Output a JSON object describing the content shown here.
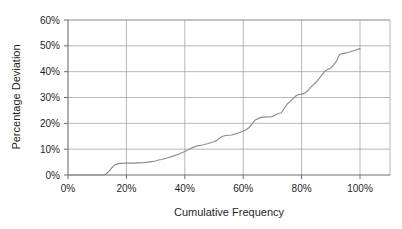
{
  "chart_data": {
    "type": "line",
    "title": "",
    "xlabel": "Cumulative Frequency",
    "ylabel": "Percentage Deviation",
    "xlim": [
      0,
      100
    ],
    "ylim": [
      0,
      60
    ],
    "grid": true,
    "legend": "none",
    "x_ticks": [
      "0%",
      "20%",
      "40%",
      "60%",
      "80%",
      "100%"
    ],
    "x_tick_values": [
      0,
      20,
      40,
      60,
      80,
      100
    ],
    "y_ticks": [
      "0%",
      "10%",
      "20%",
      "30%",
      "40%",
      "50%",
      "60%"
    ],
    "y_tick_values": [
      0,
      10,
      20,
      30,
      40,
      50,
      60
    ],
    "series": [
      {
        "name": "Percentage Deviation",
        "color": "#8c8c8c",
        "x": [
          0,
          4,
          8,
          12,
          13,
          14,
          15,
          16,
          17,
          18,
          20,
          22,
          24,
          26,
          28,
          30,
          31,
          32,
          34,
          36,
          38,
          40,
          41,
          42,
          44,
          46,
          48,
          50,
          51,
          52,
          53,
          54,
          56,
          58,
          60,
          61,
          62,
          63,
          64,
          66,
          68,
          70,
          71,
          72,
          73,
          74,
          75,
          76,
          77,
          78,
          79,
          80,
          81,
          82,
          83,
          84,
          85,
          86,
          87,
          88,
          89,
          90,
          91,
          92,
          93,
          94,
          95,
          96,
          97,
          98,
          99,
          100
        ],
        "y": [
          0,
          0,
          0,
          0,
          0.4,
          1.4,
          2.8,
          3.9,
          4.3,
          4.5,
          4.6,
          4.6,
          4.7,
          4.8,
          5.1,
          5.4,
          5.8,
          6.0,
          6.6,
          7.3,
          8.1,
          9.1,
          9.7,
          10.3,
          11.2,
          11.6,
          12.2,
          12.9,
          13.4,
          14.3,
          15.0,
          15.3,
          15.5,
          16.1,
          17.0,
          17.5,
          18.4,
          19.7,
          21.2,
          22.3,
          22.5,
          22.6,
          23.2,
          23.8,
          24.0,
          25.7,
          27.4,
          28.4,
          29.5,
          30.6,
          31.2,
          31.3,
          31.6,
          32.5,
          33.8,
          34.9,
          36.0,
          37.3,
          38.8,
          40.2,
          40.9,
          41.4,
          42.6,
          44.2,
          46.6,
          47.0,
          47.2,
          47.4,
          47.8,
          48.2,
          48.6,
          48.9
        ]
      }
    ]
  },
  "axes": {
    "y_axis_title": "Percentage Deviation",
    "x_axis_title": "Cumulative Frequency"
  },
  "header": {
    "clipped_title": ""
  }
}
